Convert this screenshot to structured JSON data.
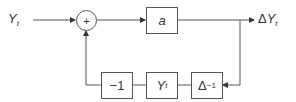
{
  "diagram": {
    "input": {
      "symbol": "Y",
      "subscript": "t"
    },
    "summing_junction": {
      "sign": "+"
    },
    "forward_block": {
      "label": "a"
    },
    "output": {
      "prefix": "Δ",
      "symbol": "Y",
      "subscript": "t"
    },
    "feedback_blocks": [
      {
        "label": "−1"
      },
      {
        "symbol": "Y",
        "subscript": "t"
      },
      {
        "base": "Δ",
        "exponent": "−1"
      }
    ],
    "colors": {
      "line": "#555555",
      "text": "#333333",
      "background": "#ffffff"
    }
  }
}
